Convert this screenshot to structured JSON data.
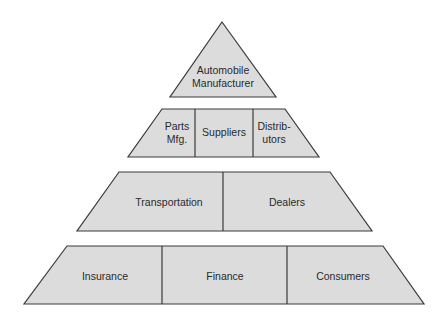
{
  "diagram": {
    "type": "pyramid",
    "colors": {
      "fill": "#dcdcdc",
      "stroke": "#3a3a3a",
      "text": "#2a2a2a",
      "background": "#ffffff"
    },
    "tiers": [
      {
        "level": 1,
        "cells": [
          {
            "line1": "Automobile",
            "line2": "Manufacturer"
          }
        ]
      },
      {
        "level": 2,
        "cells": [
          {
            "line1": "Parts",
            "line2": "Mfg."
          },
          {
            "line1": "Suppliers"
          },
          {
            "line1": "Distrib-",
            "line2": "utors"
          }
        ]
      },
      {
        "level": 3,
        "cells": [
          {
            "line1": "Transportation"
          },
          {
            "line1": "Dealers"
          }
        ]
      },
      {
        "level": 4,
        "cells": [
          {
            "line1": "Insurance"
          },
          {
            "line1": "Finance"
          },
          {
            "line1": "Consumers"
          }
        ]
      }
    ]
  }
}
